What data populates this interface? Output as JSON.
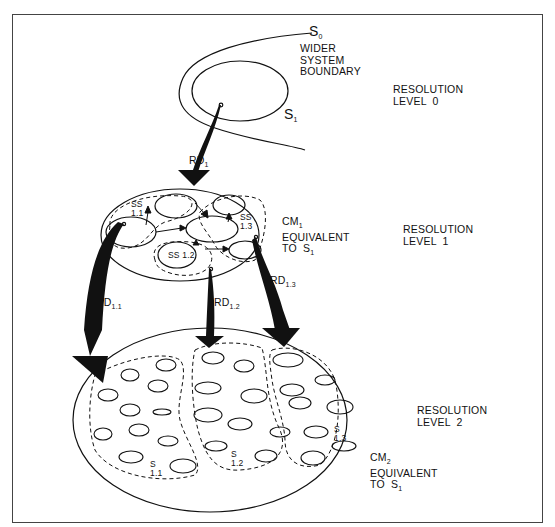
{
  "diagram": {
    "levels": {
      "level0": {
        "line1": "RESOLUTION",
        "line2": "LEVEL  0"
      },
      "level1": {
        "line1": "RESOLUTION",
        "line2": "LEVEL  1"
      },
      "level2": {
        "line1": "RESOLUTION",
        "line2": "LEVEL  2"
      }
    },
    "system0": {
      "symbol": "S",
      "sub": "0",
      "desc_line1": "WIDER",
      "desc_line2": "SYSTEM",
      "desc_line3": "BOUNDARY"
    },
    "system1": {
      "symbol": "S",
      "sub": "1"
    },
    "rd1": {
      "text": "RD",
      "sub": "1"
    },
    "cm1": {
      "symbol": "CM",
      "sub": "1",
      "line2": "EQUIVALENT",
      "line3": "TO  S",
      "line3_sub": "1"
    },
    "ss11": {
      "line1": "SS",
      "line2": "1.1"
    },
    "ss12": {
      "text": "SS 1.2"
    },
    "ss13": {
      "line1": "SS",
      "line2": "1.3"
    },
    "rd11": {
      "text": "RD",
      "sub": "1.1"
    },
    "rd12": {
      "text": "RD",
      "sub": "1.2"
    },
    "rd13": {
      "text": "RD",
      "sub": "1.3"
    },
    "s11": {
      "line1": "S",
      "line2": "1.1"
    },
    "s12": {
      "line1": "S",
      "line2": "1.2"
    },
    "s13": {
      "line1": "S",
      "line2": "1.3"
    },
    "cm2": {
      "symbol": "CM",
      "sub": "2",
      "line2": "EQUIVALENT",
      "line3": "TO  S",
      "line3_sub": "1"
    }
  },
  "colors": {
    "ink": "#111111",
    "frame": "#444444",
    "background": "#ffffff"
  }
}
